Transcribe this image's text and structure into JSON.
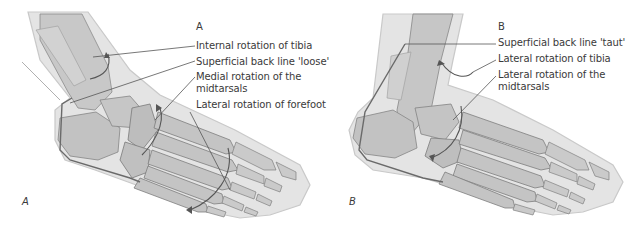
{
  "figure": {
    "panels": [
      {
        "id": "A",
        "corner_label": "A",
        "heading": "A",
        "annotations": [
          "Internal rotation of tibia",
          "Superficial back line 'loose'",
          "Medial rotation of the",
          "midtarsals",
          "Lateral rotation of forefoot"
        ]
      },
      {
        "id": "B",
        "corner_label": "B",
        "heading": "B",
        "annotations": [
          "Superficial back line 'taut'",
          "Lateral rotation of tibia",
          "Lateral rotation of the",
          "midtarsals"
        ]
      }
    ],
    "colors": {
      "skin": "#e2e2e2",
      "skin_edge": "#c4c4c4",
      "bone": "#bdbdbd",
      "bone_edge": "#7a7a7a",
      "line": "#555555",
      "text": "#3a3a3a"
    }
  }
}
